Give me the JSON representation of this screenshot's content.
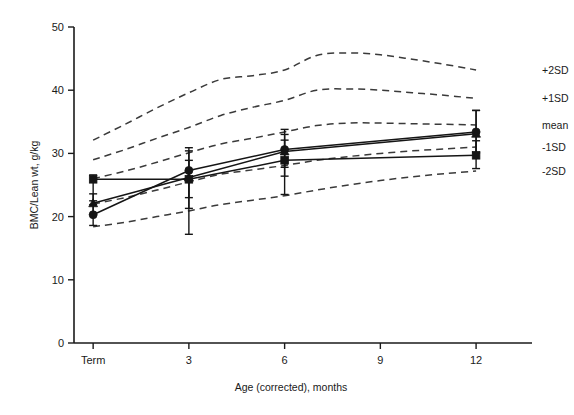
{
  "chart_data": {
    "type": "line",
    "title": "",
    "xlabel": "Age (corrected), months",
    "ylabel": "BMC/Lean wt, g/kg",
    "x_ticklabels": [
      "Term",
      "3",
      "6",
      "9",
      "12"
    ],
    "x_tickvalues": [
      0,
      3,
      6,
      9,
      12
    ],
    "y_ticklabels": [
      "0",
      "10",
      "20",
      "30",
      "40",
      "50"
    ],
    "y_tickvalues": [
      0,
      10,
      20,
      30,
      40,
      50
    ],
    "xlim": [
      -0.6,
      13.0
    ],
    "ylim": [
      0,
      50
    ],
    "grid": false,
    "legend_position": "right-outside",
    "legend_entries": [
      "+2SD",
      "+1SD",
      "mean",
      "-1SD",
      "-2SD"
    ],
    "reference_curves": [
      {
        "name": "+2SD",
        "style": "dashed",
        "x": [
          0,
          1,
          2,
          3,
          4,
          5,
          6,
          7,
          8,
          9,
          10,
          11,
          12
        ],
        "y": [
          32.1,
          34.6,
          37.2,
          39.6,
          41.7,
          42.3,
          43.2,
          45.5,
          45.9,
          45.6,
          44.9,
          44.1,
          43.2
        ]
      },
      {
        "name": "+1SD",
        "style": "dashed",
        "x": [
          0,
          1,
          2,
          3,
          4,
          5,
          6,
          7,
          8,
          9,
          10,
          11,
          12
        ],
        "y": [
          29.0,
          30.6,
          32.4,
          34.1,
          36.0,
          37.3,
          38.4,
          40.0,
          40.2,
          40.0,
          39.6,
          39.2,
          38.7
        ]
      },
      {
        "name": "mean",
        "style": "dashed",
        "x": [
          0,
          1,
          2,
          3,
          4,
          5,
          6,
          7,
          8,
          9,
          10,
          11,
          12
        ],
        "y": [
          26.0,
          27.2,
          28.6,
          30.1,
          31.5,
          32.4,
          33.4,
          34.4,
          34.8,
          34.8,
          34.7,
          34.6,
          34.5
        ]
      },
      {
        "name": "-1SD",
        "style": "dashed",
        "x": [
          0,
          1,
          2,
          3,
          4,
          5,
          6,
          7,
          8,
          9,
          10,
          11,
          12
        ],
        "y": [
          22.0,
          23.0,
          24.2,
          25.5,
          26.7,
          27.4,
          28.1,
          28.9,
          29.5,
          30.0,
          30.4,
          30.7,
          31.0
        ]
      },
      {
        "name": "-2SD",
        "style": "dashed",
        "x": [
          0,
          1,
          2,
          3,
          4,
          5,
          6,
          7,
          8,
          9,
          10,
          11,
          12
        ],
        "y": [
          18.4,
          19.1,
          20.0,
          20.9,
          21.9,
          22.6,
          23.3,
          24.2,
          25.0,
          25.7,
          26.3,
          26.8,
          27.2
        ]
      }
    ],
    "series": [
      {
        "name": "group-circle",
        "marker": "circle",
        "style": "solid",
        "x": [
          0,
          3,
          6,
          12
        ],
        "values": [
          20.3,
          27.3,
          30.6,
          33.4
        ],
        "err_low": [
          20.3,
          23.0,
          27.8,
          30.1
        ],
        "err_high": [
          21.9,
          30.4,
          33.8,
          36.8
        ]
      },
      {
        "name": "group-triangle",
        "marker": "triangle",
        "style": "solid",
        "x": [
          0,
          3,
          6,
          12
        ],
        "values": [
          22.1,
          26.2,
          30.3,
          33.1
        ],
        "err_low": [
          18.6,
          21.3,
          26.4,
          30.1
        ],
        "err_high": [
          23.6,
          30.9,
          33.0,
          36.8
        ]
      },
      {
        "name": "group-square",
        "marker": "square",
        "style": "solid",
        "x": [
          0,
          3,
          6,
          12
        ],
        "values": [
          25.9,
          25.9,
          28.9,
          29.7
        ],
        "err_low": [
          22.5,
          17.2,
          23.5,
          27.6
        ],
        "err_high": [
          26.6,
          28.9,
          32.1,
          32.0
        ]
      }
    ]
  }
}
